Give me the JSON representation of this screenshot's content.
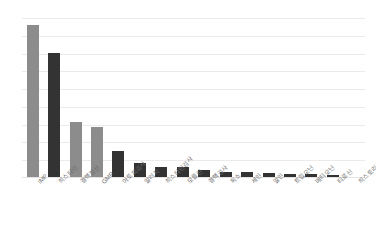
{
  "chart_data": {
    "type": "bar",
    "title": "",
    "subtitle": "",
    "xlabel": "",
    "ylabel": "",
    "categories": [
      "IMP",
      "히스타민",
      "결핵항산",
      "GMP",
      "아토피검사",
      "알러지",
      "히스타민검사",
      "모를린",
      "결핵검사",
      "독소",
      "세린",
      "알린",
      "트립오닌",
      "메티오닌",
      "티로신",
      "히스토리신"
    ],
    "values": [
      153,
      125,
      56,
      51,
      27,
      15,
      11,
      11,
      8,
      6,
      6,
      5,
      4,
      4,
      3,
      1
    ],
    "bar_colors": [
      "#8c8c8c",
      "#333333",
      "#8c8c8c",
      "#8c8c8c",
      "#333333",
      "#333333",
      "#333333",
      "#333333",
      "#333333",
      "#333333",
      "#333333",
      "#333333",
      "#333333",
      "#333333",
      "#333333",
      "#333333"
    ],
    "ylim": [
      0,
      160
    ],
    "grid": true,
    "gridline_count": 9,
    "legend": [],
    "legend_position": "none",
    "annotations": []
  },
  "palette": {
    "background": "#ffffff",
    "gridline": "#eceaea",
    "baseline": "#e4e2e2",
    "bar_light": "#8c8c8c",
    "bar_dark": "#333333",
    "tick_label": "#6f6f6f"
  }
}
